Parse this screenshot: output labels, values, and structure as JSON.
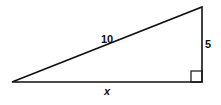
{
  "diagram": {
    "type": "right-triangle",
    "hypotenuse_label": "10",
    "vertical_leg_label": "5",
    "horizontal_leg_label": "x",
    "right_angle_marker": true,
    "stroke_color": "#111111"
  }
}
